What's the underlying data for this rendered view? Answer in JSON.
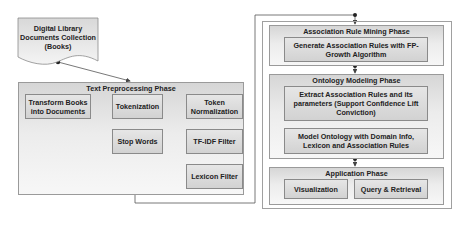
{
  "source": {
    "label_lines": [
      "Digital Library",
      "Documents Collection",
      "(Books)"
    ]
  },
  "text_preprocessing": {
    "title": "Text Preprocessing Phase",
    "transform_books": "Transform Books into Documents",
    "tokenization": "Tokenization",
    "stop_words": "Stop Words",
    "token_normalization": "Token Normalization",
    "tfidf_filter": "TF-IDF Filter",
    "lexicon_filter": "Lexicon Filter"
  },
  "association_mining": {
    "title": "Association Rule Mining Phase",
    "generate_rules": "Generate Association Rules with FP-Growth Algorithm"
  },
  "ontology_modeling": {
    "title": "Ontology Modeling Phase",
    "extract_rules": "Extract Association Rules and its parameters (Support Confidence Lift Conviction)",
    "model_ontology": "Model Ontology with Domain Info, Lexicon and Association Rules"
  },
  "application": {
    "title": "Application Phase",
    "visualization": "Visualization",
    "query_retrieval": "Query & Retrieval"
  },
  "colors": {
    "line": "#555555",
    "box_border": "#8a8a8a"
  }
}
